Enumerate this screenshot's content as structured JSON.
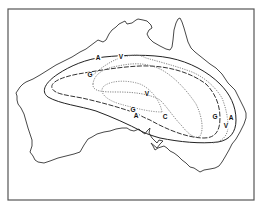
{
  "figure": {
    "type": "map",
    "region": "Australia",
    "frame_color": "#555555",
    "coast_color": "#333333"
  },
  "contours": [
    {
      "id": "A",
      "label": "A",
      "style": "solid"
    },
    {
      "id": "G",
      "label": "G",
      "style": "dashed"
    },
    {
      "id": "V",
      "label": "V",
      "style": "dotted"
    },
    {
      "id": "C",
      "label": "C",
      "style": "dotted"
    }
  ],
  "labels": [
    {
      "text": "A",
      "x": 98,
      "y": 58
    },
    {
      "text": "V",
      "x": 121,
      "y": 57
    },
    {
      "text": "G",
      "x": 90,
      "y": 75
    },
    {
      "text": "V",
      "x": 147,
      "y": 94
    },
    {
      "text": "G",
      "x": 133,
      "y": 110
    },
    {
      "text": "A",
      "x": 136,
      "y": 116
    },
    {
      "text": "C",
      "x": 165,
      "y": 117
    },
    {
      "text": "G",
      "x": 215,
      "y": 117
    },
    {
      "text": "A",
      "x": 231,
      "y": 118
    },
    {
      "text": "V",
      "x": 226,
      "y": 126
    }
  ]
}
